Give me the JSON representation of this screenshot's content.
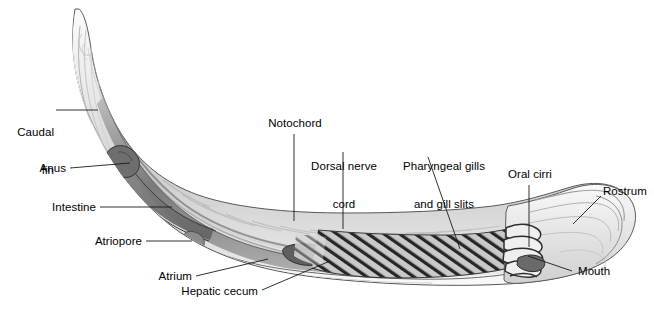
{
  "figure": {
    "background_color": "#ffffff",
    "label_color": "#000000",
    "leader_color": "#1a1a1a",
    "body_outline_color": "#4a4a4a",
    "body_fill_light": "#f2f2f2",
    "body_fill_mid": "#d6d6d6",
    "body_fill_dark": "#8f8f8f",
    "gill_hatch_color": "#2b2b2b"
  },
  "labels": {
    "caudal_fin": "Caudal\nfin",
    "caudal_fin_line1": "Caudal",
    "caudal_fin_line2": "fin",
    "anus": "Anus",
    "intestine": "Intestine",
    "atriopore": "Atriopore",
    "atrium": "Atrium",
    "hepatic_cecum": "Hepatic cecum",
    "notochord": "Notochord",
    "dorsal_nerve_cord_line1": "Dorsal nerve",
    "dorsal_nerve_cord_line2": "cord",
    "pharyngeal_gills_line1": "Pharyngeal gills",
    "pharyngeal_gills_line2": "and gill slits",
    "oral_cirri": "Oral cirri",
    "rostrum": "Rostrum",
    "mouth": "Mouth"
  }
}
